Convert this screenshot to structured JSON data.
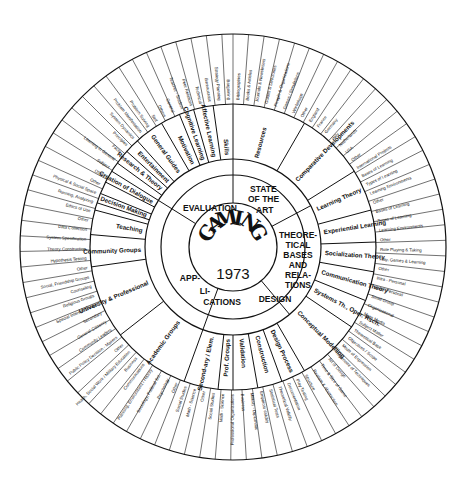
{
  "diagram": {
    "center": {
      "title": "GAMING",
      "year": "1973"
    },
    "sectors": [
      {
        "label": "STATE OF THE ART",
        "lines": [
          "STATE",
          "OF THE",
          "ART"
        ]
      },
      {
        "label": "THEORETICAL BASES AND RELATIONS",
        "lines": [
          "THEORE-",
          "TICAL",
          "BASES",
          "AND",
          "RELA-",
          "TIONS"
        ]
      },
      {
        "label": "DESIGN",
        "lines": [
          "DESIGN"
        ]
      },
      {
        "label": "APPLICATIONS",
        "lines": [
          "APP-",
          "LI-",
          "CATIONS"
        ]
      },
      {
        "label": "EVALUATION",
        "lines": [
          "EVALUATION"
        ]
      }
    ],
    "ring2_labels": {
      "applications": "Users & Contexts of Use",
      "evaluation": "Purposes"
    },
    "middle_ring": [
      {
        "label": "Resources",
        "sector": "STATE OF THE ART"
      },
      {
        "label": "Comparative Developments",
        "sector": "STATE OF THE ART"
      },
      {
        "label": "Learning Theory",
        "sector": "THEORETICAL BASES AND RELATIONS"
      },
      {
        "label": "Experiential Learning",
        "sector": "THEORETICAL BASES AND RELATIONS"
      },
      {
        "label": "Socialization Theory",
        "sector": "THEORETICAL BASES AND RELATIONS"
      },
      {
        "label": "Communication Theory",
        "sector": "THEORETICAL BASES AND RELATIONS"
      },
      {
        "label": "Systems Theory, Operations Rsch., Game Theory, Other",
        "sector": "THEORETICAL BASES AND RELATIONS"
      },
      {
        "label": "Conceptual Modelling",
        "sector": "DESIGN"
      },
      {
        "label": "Design Process",
        "sector": "DESIGN"
      },
      {
        "label": "Construction",
        "sector": "DESIGN"
      },
      {
        "label": "Pragmatics",
        "sector": "DESIGN"
      },
      {
        "label": "Validation",
        "sector": "DESIGN"
      },
      {
        "label": "Professional Groups",
        "sector": "APPLICATIONS"
      },
      {
        "label": "Secondary",
        "sector": "APPLICATIONS"
      },
      {
        "label": "Elementary",
        "sector": "APPLICATIONS"
      },
      {
        "label": "Academic Groups",
        "sector": "APPLICATIONS"
      },
      {
        "label": "University & Professional",
        "sector": "APPLICATIONS"
      },
      {
        "label": "Community Groups",
        "sector": "APPLICATIONS"
      },
      {
        "label": "Teaching",
        "sector": "EVALUATION"
      },
      {
        "label": "Training",
        "sector": "EVALUATION"
      },
      {
        "label": "Operational Gaming",
        "sector": "EVALUATION"
      },
      {
        "label": "Decision Making",
        "sector": "EVALUATION"
      },
      {
        "label": "Problem Exploration",
        "sector": "EVALUATION"
      },
      {
        "label": "Creation of Dialogue",
        "sector": "EVALUATION"
      },
      {
        "label": "Research & Theory Construction",
        "sector": "EVALUATION"
      },
      {
        "label": "Entertainment",
        "sector": "EVALUATION"
      },
      {
        "label": "General Guides",
        "sector": "EVALUATION"
      },
      {
        "label": "Motivation, Interest",
        "sector": "EVALUATION"
      },
      {
        "label": "Cognitive Learning",
        "sector": "EVALUATION"
      },
      {
        "label": "Affective Learning",
        "sector": "EVALUATION"
      },
      {
        "label": "Class-Group Structure",
        "sector": "EVALUATION"
      },
      {
        "label": "Skills",
        "sector": "EVALUATION"
      }
    ],
    "outer_ring": {
      "resources": [
        "Bibliographies",
        "Books & Articles",
        "Journals & Newsletters",
        "Guides & Directories",
        "People & Organizations",
        "Games / Simulations",
        "Workshops",
        "Other"
      ],
      "comparative": [
        "England",
        "France",
        "Germany",
        "Italy",
        "Netherlands",
        "USA",
        "Other",
        "International Projects"
      ],
      "learning_theory": [
        "Bases of Learning",
        "Types of Learning",
        "Learning Environments",
        "Other"
      ],
      "experiential": [
        "Bases of Learning",
        "Types of Learning",
        "Learning Environments",
        "Other"
      ],
      "socialization": [
        "Role Playing & Taking",
        "Play, Games & Learning",
        "Other"
      ],
      "communication": [
        "Intra - Personal",
        "Inter - Personal",
        "Small Group",
        "Organizational",
        "Mass Media"
      ],
      "design": [
        "Subject Matter",
        "Theoretical Base",
        "Objectives / Scope",
        "Mode of Expression",
        "Repertoire of Techniques",
        "Art of Design",
        "Time & Size of Game",
        "Realism & Abstraction",
        "Structure",
        "Play Testing",
        "Documentation",
        "Theoretical Validity",
        "Statistical Tests",
        "Empirical Validity",
        "Military - Diplomatic",
        "Business"
      ],
      "professional": [
        "Professional Organizations",
        "Math - Science",
        "Social Studies",
        "Other"
      ],
      "university": [
        "Math - Science",
        "Social Studies",
        "Other",
        "Psychology",
        "Sociology, Political Sci.",
        "Planning, Environment / History",
        "Communications",
        "Business",
        "Health, Social Work / Military Education",
        "Other"
      ],
      "community": [
        "Public Policy Decision - Makers",
        "Community Leaders",
        "General Citizenry",
        "Secondary",
        "Special Interest Groups",
        "Religious Groups",
        "Counseling",
        "Social, Friendship Groups",
        "Other"
      ],
      "purposes": [
        "Hypothesis Testing",
        "Theory Construction",
        "System Specification",
        "Data Collection",
        "Other"
      ],
      "guides": [
        "Ethics of Use",
        "Running, Analyzing",
        "Physical & Social Space",
        "Other"
      ],
      "cognitive": [
        "Other",
        "Subject",
        "Learning in General",
        "Facts",
        "Principles",
        "System Dynamics",
        "Problem Manifestation",
        "Problem Solving"
      ],
      "affective": [
        "Self",
        "Others",
        "General"
      ],
      "class_group": [
        "Teacher - Student",
        "Peer Relations"
      ],
      "skills": [
        "Technical",
        "Bureaucratic",
        "Strategy Planning",
        "Bargaining"
      ]
    }
  }
}
